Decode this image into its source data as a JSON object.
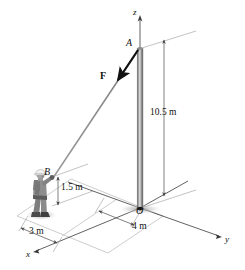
{
  "figure": {
    "kind": "statics-free-body-diagram"
  },
  "points": {
    "A": "A",
    "B": "B",
    "O": "O"
  },
  "axes": {
    "z": "z",
    "x": "x",
    "y": "y"
  },
  "force": {
    "label": "F"
  },
  "dimensions": {
    "pole_height": "10.5 m",
    "hand_height": "1.5 m",
    "x_offset": "3 m",
    "y_offset": "4 m"
  },
  "colors": {
    "line": "#1a1a1a",
    "thin_line": "#7c7c7c",
    "cable": "#8a8a8a",
    "pole_dark": "#6d6d6d",
    "pole_light": "#e4e4e4",
    "figure_body": "#8b8b8b",
    "figure_dark": "#5a5a5a",
    "helmet": "#f0f0f0",
    "shadow": "#b9b9b9",
    "background": "#ffffff"
  },
  "geometry": {
    "pole_top_px": [
      140,
      48
    ],
    "pole_base_px": [
      140,
      208
    ],
    "hand_px": [
      52,
      177
    ],
    "foot_px": [
      52,
      205
    ]
  }
}
